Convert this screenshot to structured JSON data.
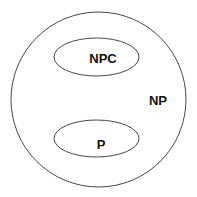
{
  "diagram": {
    "title": "",
    "sets": [
      {
        "id": "np",
        "label": "NP",
        "shape": "circle"
      },
      {
        "id": "npc",
        "label": "NPC",
        "shape": "ellipse",
        "inside": "np"
      },
      {
        "id": "p",
        "label": "P",
        "shape": "ellipse",
        "inside": "np"
      }
    ],
    "colors": {
      "stroke": "#333333",
      "text": "#111111",
      "background": "#ffffff"
    }
  }
}
